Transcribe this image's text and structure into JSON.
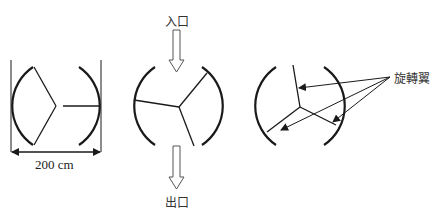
{
  "diagram": {
    "labels": {
      "inlet": "入口",
      "outlet": "出口",
      "rotor_blades": "旋轉翼",
      "dimension": "200 cm"
    },
    "panels": [
      {
        "name": "rotor-position-1",
        "description": "cross-section with dimension"
      },
      {
        "name": "rotor-position-2",
        "description": "cross-section with inlet/outlet flow"
      },
      {
        "name": "rotor-position-3",
        "description": "cross-section with rotor blade callouts"
      }
    ],
    "colors": {
      "stroke": "#1a1a1a",
      "text": "#333333"
    }
  }
}
